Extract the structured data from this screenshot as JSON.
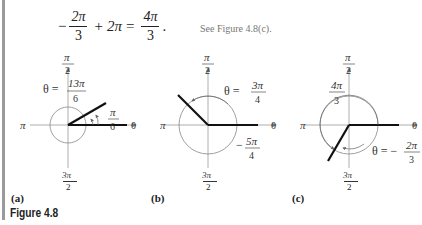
{
  "equation": {
    "minus": "−",
    "f1_num": "2π",
    "f1_den": "3",
    "plus": "+",
    "term2": "2π",
    "equals": "=",
    "f2_num": "4π",
    "f2_den": "3",
    "period": "."
  },
  "see_note": "See Figure 4.8(c).",
  "axis_labels": {
    "top_num": "π",
    "top_den": "2",
    "left": "π",
    "right": "0",
    "bottom_num": "3π",
    "bottom_den": "2"
  },
  "panels": [
    {
      "label": "(a)",
      "theta_prefix": "θ =",
      "theta_num": "13π",
      "theta_den": "6",
      "ref_num": "π",
      "ref_den": "6"
    },
    {
      "label": "(b)",
      "theta_prefix": "θ =",
      "theta_num": "3π",
      "theta_den": "4",
      "ref_prefix": "−",
      "ref_num": "5π",
      "ref_den": "4"
    },
    {
      "label": "(c)",
      "theta_prefix": "θ = −",
      "theta_num": "2π",
      "theta_den": "3",
      "ref_num": "4π",
      "ref_den": "3"
    }
  ],
  "caption": "Figure 4.8"
}
